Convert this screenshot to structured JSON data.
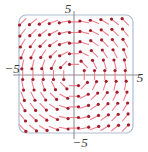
{
  "figure": {
    "kind": "vector-field-plot",
    "title": "",
    "background": "#ffffff",
    "frame": {
      "stroke": "#aebcd0",
      "fill": "#fefeff",
      "corner_radius": 7,
      "left": 19,
      "top": 15,
      "width": 114,
      "height": 118
    },
    "axes": {
      "stroke": "#8e8e96",
      "x_axis_y": 75,
      "y_axis_x": 74,
      "x_extent": [
        13,
        141
      ],
      "y_extent": [
        11,
        139
      ]
    },
    "labels": {
      "top": "5",
      "bottom": "−5",
      "left": "−5",
      "right": "5"
    },
    "arrow_style": {
      "head_color": "#a11d2a",
      "tail_color": "#ef7f8c",
      "head_radius": 1.6,
      "length": 9
    }
  },
  "chart_data": {
    "type": "scatter",
    "title": "",
    "xlabel": "",
    "ylabel": "",
    "xlim": [
      -5,
      5
    ],
    "ylim": [
      -5,
      5
    ],
    "grid": false,
    "legend": null,
    "xticks": [
      -5,
      5
    ],
    "yticks": [
      -5,
      5
    ],
    "xticklabels": [
      "−5",
      "5"
    ],
    "yticklabels": [
      "−5",
      "5"
    ],
    "field": {
      "description": "counterclockwise rotational direction field",
      "u_formula": "-y",
      "v_formula": "x",
      "grid_n": 11,
      "sample_min": -4.5,
      "sample_max": 4.5
    },
    "series": [
      {
        "name": "direction field arrows",
        "color": "#a11d2a",
        "x": [
          -4.5,
          -3.6,
          -2.7,
          -1.8,
          -0.9,
          0,
          0.9,
          1.8,
          2.7,
          3.6,
          4.5
        ],
        "y": [
          -4.5,
          -3.6,
          -2.7,
          -1.8,
          -0.9,
          0,
          0.9,
          1.8,
          2.7,
          3.6,
          4.5
        ]
      }
    ]
  }
}
